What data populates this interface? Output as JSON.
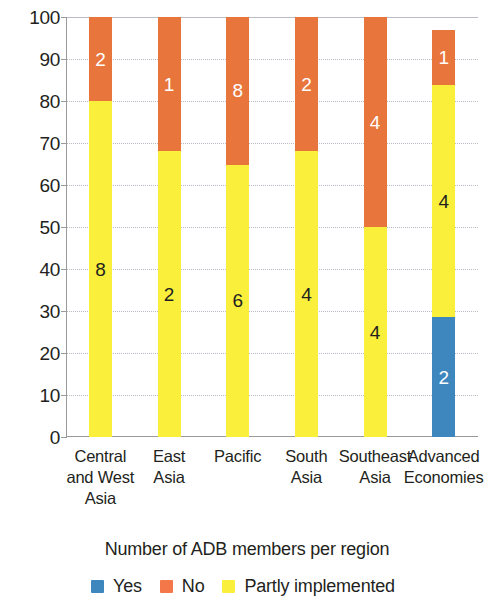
{
  "chart_data": {
    "type": "bar",
    "stacked": true,
    "stack_mode": "percent",
    "title": "",
    "xlabel": "Number of ADB members per region",
    "ylabel": "",
    "ylim": [
      0,
      100
    ],
    "ytick_step": 10,
    "grid": true,
    "legend_position": "bottom",
    "categories": [
      "Central and West Asia",
      "East Asia",
      "Pacific",
      "South Asia",
      "Southeast Asia",
      "Advanced Economies"
    ],
    "category_lines": [
      [
        "Central",
        "and West",
        "Asia"
      ],
      [
        "East",
        "Asia"
      ],
      [
        "Pacific"
      ],
      [
        "South",
        "Asia"
      ],
      [
        "Southeast",
        "Asia"
      ],
      [
        "Advanced",
        "Economies"
      ]
    ],
    "series": [
      {
        "name": "Yes",
        "color": "#3d86be",
        "values": [
          0,
          0,
          0,
          0,
          0,
          2
        ],
        "percents": [
          0,
          0,
          0,
          0,
          0,
          28.5
        ]
      },
      {
        "name": "Partly implemented",
        "color": "#faf03c",
        "values": [
          8,
          2,
          6,
          4,
          4,
          4
        ],
        "percents": [
          80,
          68,
          64.8,
          68,
          50,
          55.2
        ]
      },
      {
        "name": "No",
        "color": "#e8763c",
        "values": [
          2,
          1,
          8,
          2,
          4,
          1
        ],
        "percents": [
          20,
          32,
          35.2,
          32,
          50,
          13.3
        ]
      }
    ],
    "column_totals": [
      100,
      100,
      100,
      100,
      100,
      97
    ],
    "ytick_labels": [
      "100",
      "90",
      "80",
      "70",
      "60",
      "50",
      "40",
      "30",
      "20",
      "10",
      "0"
    ],
    "ytick_values": [
      100,
      90,
      80,
      70,
      60,
      50,
      40,
      30,
      20,
      10,
      0
    ],
    "legend": [
      {
        "label": "Yes",
        "color": "#3d86be"
      },
      {
        "label": "No",
        "color": "#f4774a"
      },
      {
        "label": "Partly implemented",
        "color": "#faf03c"
      }
    ]
  }
}
